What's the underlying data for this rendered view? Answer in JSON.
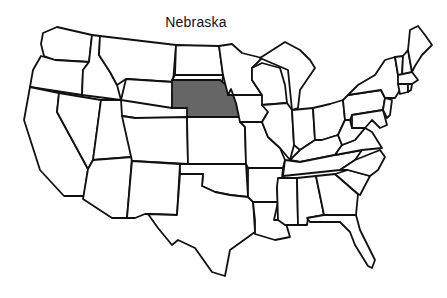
{
  "title": "Nebraska",
  "map": {
    "type": "US states outline map",
    "highlighted_state": "Nebraska",
    "highlight_color": "#666666",
    "outline_color": "#111111",
    "background_color": "#ffffff"
  }
}
